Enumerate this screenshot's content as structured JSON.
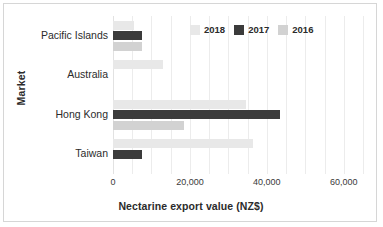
{
  "chart_data": {
    "type": "bar",
    "orientation": "horizontal",
    "title": "",
    "xlabel": "Nectarine export value (NZ$)",
    "ylabel": "Market",
    "categories": [
      "Pacific Islands",
      "Australia",
      "Hong Kong",
      "Taiwan"
    ],
    "series": [
      {
        "name": "2018",
        "color": "#e8e8e8",
        "values": [
          5500,
          13000,
          34500,
          36500
        ]
      },
      {
        "name": "2017",
        "color": "#3b3b3b",
        "values": [
          7500,
          0,
          43500,
          7500
        ]
      },
      {
        "name": "2016",
        "color": "#d2d2d2",
        "values": [
          7500,
          0,
          18500,
          0
        ]
      }
    ],
    "xlim": [
      0,
      65000
    ],
    "xticks": [
      0,
      20000,
      40000,
      60000
    ],
    "xtick_labels": [
      "0",
      "20,000",
      "40,000",
      "60,000"
    ],
    "gridline_interval": 5000,
    "grid": true,
    "legend_position": "top-right"
  },
  "legend": {
    "items": [
      {
        "label": "2018",
        "swatch": "legend-swatch-2018"
      },
      {
        "label": "2017",
        "swatch": "legend-swatch-2017"
      },
      {
        "label": "2016",
        "swatch": "legend-swatch-2016"
      }
    ]
  },
  "colors": {
    "series_2018": "#e8e8e8",
    "series_2017": "#3b3b3b",
    "series_2016": "#d2d2d2",
    "grid": "#ececec",
    "text": "#2b2b2b",
    "frame": "#d6d6d6",
    "background": "#ffffff"
  }
}
